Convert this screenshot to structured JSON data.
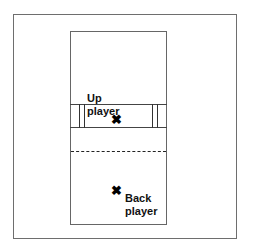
{
  "diagram": {
    "labels": {
      "up_line1": "Up",
      "up_line2": "player",
      "back_line1": "Back",
      "back_line2": "player"
    },
    "markers": {
      "up_marker": "✖",
      "back_marker": "✖"
    },
    "elements": [
      {
        "type": "outer-frame"
      },
      {
        "type": "court-outline"
      },
      {
        "type": "net-band",
        "note": "band with double sidelines"
      },
      {
        "type": "dashed-line",
        "note": "midcourt dashed line"
      },
      {
        "type": "player-marker",
        "label": "Up player"
      },
      {
        "type": "player-marker",
        "label": "Back player"
      }
    ]
  }
}
